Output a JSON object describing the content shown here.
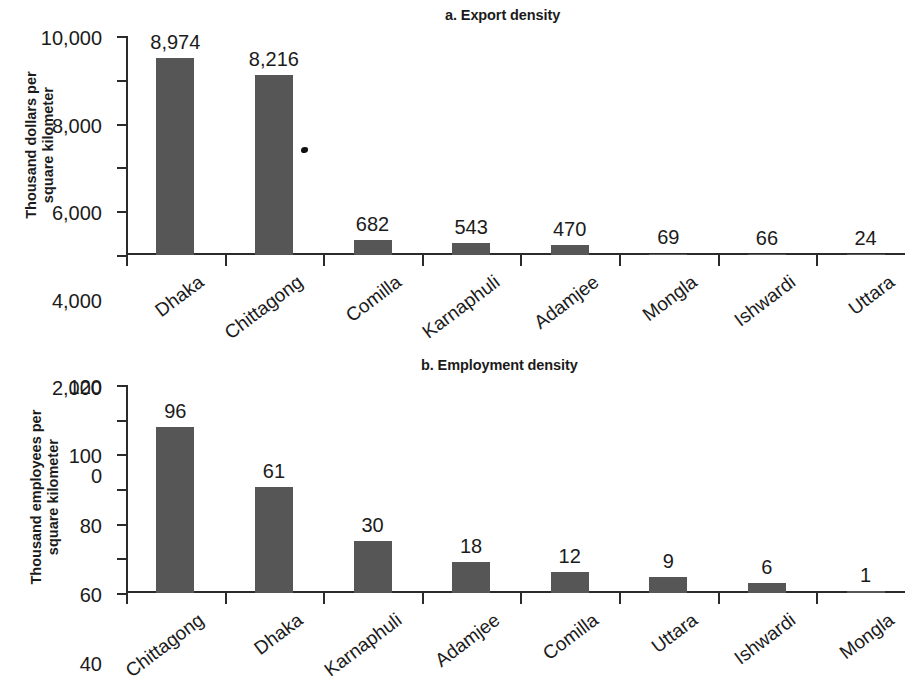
{
  "figure": {
    "background_color": "#ffffff",
    "bar_color": "#565656",
    "axis_color": "#2b2b2b",
    "text_color": "#1b1b1b"
  },
  "panel_a": {
    "title": "a. Export density",
    "axis_caption_line1": "Thousand dollars per",
    "axis_caption_line2": "square kilometer"
  },
  "panel_b": {
    "title": "b. Employment density",
    "axis_caption_line1": "Thousand employees per",
    "axis_caption_line2": "square kilometer"
  },
  "chart_data": [
    {
      "type": "bar",
      "title": "a. Export density",
      "xlabel": "",
      "ylabel": "Thousand dollars per square kilometer",
      "ylim": [
        0,
        10000
      ],
      "yticks": [
        0,
        2000,
        4000,
        6000,
        8000,
        10000
      ],
      "ytick_labels": [
        "0",
        "2,000",
        "4,000",
        "6,000",
        "8,000",
        "10,000"
      ],
      "grid": false,
      "legend": "none",
      "categories": [
        "Dhaka",
        "Chittagong",
        "Comilla",
        "Karnaphuli",
        "Adamjee",
        "Mongla",
        "Ishwardi",
        "Uttara"
      ],
      "values": [
        8974,
        8216,
        682,
        543,
        470,
        69,
        66,
        24
      ],
      "value_labels": [
        "8,974",
        "8,216",
        "682",
        "543",
        "470",
        "69",
        "66",
        "24"
      ]
    },
    {
      "type": "bar",
      "title": "b. Employment density",
      "xlabel": "",
      "ylabel": "Thousand employees per square kilometer",
      "ylim": [
        0,
        120
      ],
      "yticks": [
        0,
        20,
        40,
        60,
        80,
        100,
        120
      ],
      "ytick_labels": [
        "0",
        "20",
        "40",
        "60",
        "80",
        "100",
        "120"
      ],
      "grid": false,
      "legend": "none",
      "categories": [
        "Chittagong",
        "Dhaka",
        "Karnaphuli",
        "Adamjee",
        "Comilla",
        "Uttara",
        "Ishwardi",
        "Mongla"
      ],
      "values": [
        96,
        61,
        30,
        18,
        12,
        9,
        6,
        1
      ],
      "value_labels": [
        "96",
        "61",
        "30",
        "18",
        "12",
        "9",
        "6",
        "1"
      ]
    }
  ]
}
